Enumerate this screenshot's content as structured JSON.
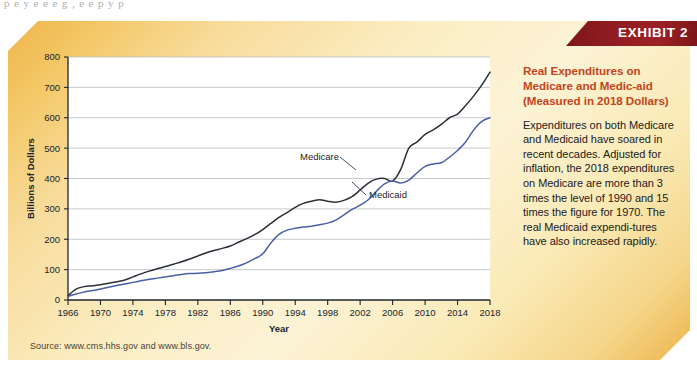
{
  "page": {
    "top_partial_text": "p  e  y   e     e   e  g ,                e    e     p y  p  "
  },
  "banner": {
    "label": "EXHIBIT 2",
    "color": "#8B1A1A"
  },
  "side": {
    "title": "Real Expenditures on Medicare and Medic-aid (Measured in 2018 Dollars)",
    "title_color": "#c4451c",
    "body": "Expenditures on both Medicare and Medicaid have soared in recent decades. Adjusted for inflation, the 2018 expenditures on Medicare are more than 3 times the level of 1990 and 15 times the figure for 1970. The real Medicaid expendi-tures have also increased rapidly."
  },
  "source": {
    "text": "Source: www.cms.hhs.gov and www.bls.gov."
  },
  "chart_data": {
    "type": "line",
    "xlabel": "Year",
    "ylabel": "Billions of Dollars",
    "xlim": [
      1966,
      2018
    ],
    "ylim": [
      0,
      800
    ],
    "yticks": [
      0,
      100,
      200,
      300,
      400,
      500,
      600,
      700,
      800
    ],
    "xticks": [
      1966,
      1970,
      1974,
      1978,
      1982,
      1986,
      1990,
      1994,
      1998,
      2002,
      2006,
      2010,
      2014,
      2018
    ],
    "grid": "horizontal",
    "legend": "inline-labels",
    "x": [
      1966,
      1967,
      1968,
      1969,
      1970,
      1971,
      1972,
      1973,
      1974,
      1975,
      1976,
      1977,
      1978,
      1979,
      1980,
      1981,
      1982,
      1983,
      1984,
      1985,
      1986,
      1987,
      1988,
      1989,
      1990,
      1991,
      1992,
      1993,
      1994,
      1995,
      1996,
      1997,
      1998,
      1999,
      2000,
      2001,
      2002,
      2003,
      2004,
      2005,
      2006,
      2007,
      2008,
      2009,
      2010,
      2011,
      2012,
      2013,
      2014,
      2015,
      2016,
      2017,
      2018
    ],
    "series": [
      {
        "name": "Medicare",
        "color": "#2b3038",
        "values": [
          14,
          36,
          44,
          47,
          50,
          55,
          60,
          66,
          76,
          86,
          95,
          103,
          110,
          118,
          126,
          135,
          145,
          155,
          163,
          170,
          178,
          190,
          202,
          215,
          232,
          252,
          272,
          288,
          305,
          318,
          325,
          330,
          325,
          322,
          328,
          340,
          362,
          385,
          398,
          400,
          392,
          430,
          500,
          520,
          545,
          560,
          578,
          600,
          612,
          640,
          672,
          708,
          750
        ]
      },
      {
        "name": "Medicaid",
        "color": "#4a5fa8",
        "values": [
          12,
          20,
          26,
          31,
          36,
          42,
          48,
          53,
          58,
          63,
          68,
          72,
          76,
          80,
          84,
          87,
          88,
          90,
          93,
          97,
          104,
          112,
          122,
          136,
          152,
          188,
          216,
          230,
          236,
          240,
          243,
          248,
          253,
          263,
          280,
          298,
          312,
          330,
          358,
          382,
          392,
          385,
          395,
          418,
          440,
          448,
          452,
          470,
          492,
          520,
          560,
          588,
          600
        ]
      }
    ],
    "annotations": [
      {
        "text": "Medicare",
        "x": 1996,
        "y": 430
      },
      {
        "text": "Medicaid",
        "x": 2003,
        "y": 345
      }
    ]
  }
}
